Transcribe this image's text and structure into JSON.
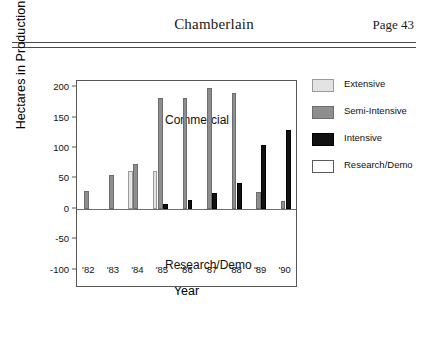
{
  "header": {
    "title": "Chamberlain",
    "page_label": "Page 43"
  },
  "chart_data": {
    "type": "bar",
    "title": "",
    "xlabel": "Year",
    "ylabel": "Hectares in Production",
    "ylim": [
      -130,
      210
    ],
    "yticks": [
      200,
      150,
      100,
      50,
      0,
      -50,
      -100
    ],
    "ytick_labels": [
      "200",
      "150",
      "100",
      "50",
      "0",
      "-50",
      "-100"
    ],
    "grid": false,
    "legend_position": "right",
    "categories": [
      "'82",
      "'83",
      "'84",
      "'85",
      "'86",
      "'87",
      "'88",
      "'89",
      "'90"
    ],
    "series": [
      {
        "name": "Extensive",
        "color": "#e3e3e3",
        "values": [
          0,
          0,
          62,
          62,
          0,
          0,
          0,
          0,
          0
        ]
      },
      {
        "name": "Semi-Intensive",
        "color": "#8e8e8e",
        "values": [
          30,
          56,
          73,
          182,
          182,
          198,
          191,
          27,
          13
        ]
      },
      {
        "name": "Intensive",
        "color": "#111111",
        "values": [
          0,
          0,
          0,
          8,
          14,
          26,
          42,
          105,
          130
        ]
      },
      {
        "name": "Research/Demo",
        "color": "#ffffff",
        "values": [
          -1.5,
          -1.5,
          -1.5,
          -2,
          -52,
          -95,
          -118,
          -3,
          -2
        ]
      }
    ],
    "annotations": [
      {
        "text": "Commercial",
        "x": "'82",
        "y": 195
      },
      {
        "text": "Research/Demo .",
        "x": "'82",
        "y": -62
      }
    ]
  },
  "legend": {
    "items": [
      {
        "label": "Extensive",
        "key": "extensive"
      },
      {
        "label": "Semi-Intensive",
        "key": "semiintensive"
      },
      {
        "label": "Intensive",
        "key": "intensive"
      },
      {
        "label": "Research/Demo",
        "key": "research"
      }
    ]
  }
}
